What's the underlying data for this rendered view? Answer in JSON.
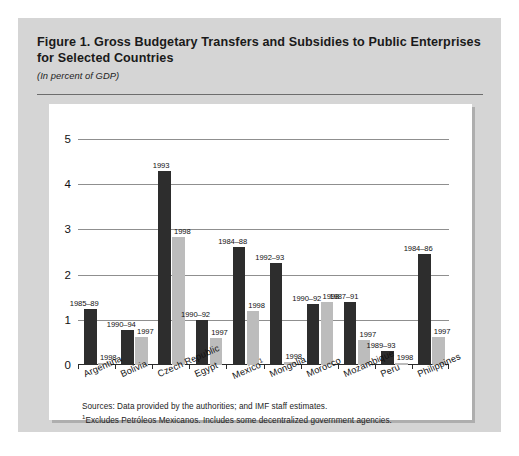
{
  "figure": {
    "title": "Figure 1.  Gross Budgetary Transfers and Subsidies to Public Enterprises for Selected Countries",
    "subtitle": "(In percent of GDP)",
    "notes": [
      "Sources:  Data provided by the authorities; and IMF staff estimates.",
      "Excludes Petróleos Mexicanos. Includes some decentralized government agencies."
    ],
    "note_marker": "1"
  },
  "colors": {
    "figure_background": "#d5d5d5",
    "panel_background": "#ffffff",
    "bar_dark": "#2d2d2d",
    "bar_light": "#bcbcbc",
    "gridline": "#8f8f8f",
    "axis": "#2b2b2b",
    "rule": "#6d6d6d"
  },
  "chart_data": {
    "type": "bar",
    "title": "Figure 1.  Gross Budgetary Transfers and Subsidies to Public Enterprises for Selected Countries",
    "subtitle": "(In percent of GDP)",
    "xlabel": "",
    "ylabel": "",
    "ylim": [
      0,
      5
    ],
    "yticks": [
      0,
      1,
      2,
      3,
      4,
      5
    ],
    "ytick_labels": [
      "0",
      "1",
      "2",
      "3",
      "4",
      "5"
    ],
    "grid": true,
    "legend": "none",
    "categories": [
      "Argentina",
      "Bolivia",
      "Czech Republic",
      "Egypt",
      "Mexico¹",
      "Mongolia",
      "Morocco",
      "Mozambique",
      "Peru",
      "Philippines"
    ],
    "series": [
      {
        "name": "Earlier period",
        "color": "#2d2d2d",
        "values": [
          1.25,
          0.78,
          4.3,
          1.0,
          2.6,
          2.25,
          1.35,
          1.4,
          0.3,
          2.45
        ],
        "point_labels": [
          "1985–89",
          "1990–94",
          "1993",
          "1990–92",
          "1984–88",
          "1992–93",
          "1990–92",
          "1987–91",
          "1989–93",
          "1984–86"
        ]
      },
      {
        "name": "Recent year",
        "color": "#bcbcbc",
        "values": [
          0.04,
          0.62,
          2.83,
          0.6,
          1.2,
          0.07,
          1.4,
          0.55,
          0.05,
          0.63
        ],
        "point_labels": [
          "1998",
          "1997",
          "1998",
          "1997",
          "1998",
          "1998",
          "1998",
          "1997",
          "1998",
          "1997"
        ]
      }
    ]
  }
}
